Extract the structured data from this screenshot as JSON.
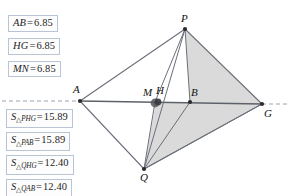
{
  "app": {
    "kind": "dynamic-geometry-sketch"
  },
  "measurements": {
    "lengths": [
      {
        "name": "AB",
        "label": "AB",
        "equals": "=",
        "value": "6.85"
      },
      {
        "name": "HG",
        "label": "HG",
        "equals": "=",
        "value": "6.85"
      },
      {
        "name": "MN",
        "label": "MN",
        "equals": "=",
        "value": "6.85"
      }
    ],
    "areas": [
      {
        "name": "S_PHG",
        "symbol": "S",
        "triangle": "△",
        "subscript": "PHG",
        "equals": "=",
        "value": "15.89"
      },
      {
        "name": "S_PAB",
        "symbol": "S",
        "triangle": "△",
        "subscript": "PAB",
        "equals": "=",
        "value": "15.89"
      },
      {
        "name": "S_QHG",
        "symbol": "S",
        "triangle": "△",
        "subscript": "QHG",
        "equals": "=",
        "value": "12.40"
      },
      {
        "name": "S_QAB",
        "symbol": "S",
        "triangle": "△",
        "subscript": "QAB",
        "equals": "=",
        "value": "12.40"
      }
    ]
  },
  "figure": {
    "vertex_labels": {
      "P": "P",
      "A": "A",
      "G": "G",
      "Q": "Q",
      "M": "M",
      "H": "H",
      "B": "B"
    },
    "points": {
      "P": [
        185,
        29
      ],
      "A": [
        80,
        101
      ],
      "G": [
        262,
        104
      ],
      "Q": [
        144,
        169
      ],
      "M": [
        154,
        102
      ],
      "H": [
        158,
        102
      ],
      "B": [
        190,
        102
      ]
    },
    "colors": {
      "stroke": "#6b6f7a",
      "shade": "#d3d3d3",
      "dash": "#9aa3b0",
      "point": "#2b2b2b"
    },
    "dashed_line_y": 101
  }
}
